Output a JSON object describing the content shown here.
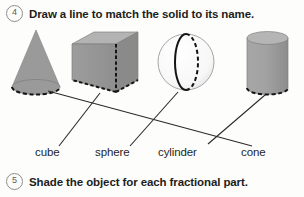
{
  "worksheet": {
    "problem4": {
      "number": "4",
      "prompt": "Draw a line to match the solid to its name."
    },
    "problem5": {
      "number": "5",
      "prompt": "Shade the object for each fractional part."
    },
    "labels": {
      "cube": "cube",
      "sphere": "sphere",
      "cylinder": "cylinder",
      "cone": "cone"
    },
    "solids": [
      {
        "name": "cone",
        "order": 1,
        "fill": "#9a9a9a",
        "hidden_edge": "dashed-base-ellipse"
      },
      {
        "name": "cube",
        "order": 2,
        "fill": "#9b9b9b",
        "hidden_edge": "dashed-back-edges"
      },
      {
        "name": "sphere",
        "order": 3,
        "fill": "#fbfbfb",
        "hidden_edge": "dashed-back-great-circle"
      },
      {
        "name": "cylinder",
        "order": 4,
        "fill": "#a0a0a0",
        "hidden_edge": "dashed-bottom-ellipse"
      }
    ],
    "connections": [
      {
        "from": "cone",
        "to": "cone"
      },
      {
        "from": "cube",
        "to": "cube"
      },
      {
        "from": "sphere",
        "to": "sphere"
      },
      {
        "from": "cylinder",
        "to": "cone"
      }
    ],
    "colors": {
      "ink": "#1d1d1d",
      "line": "#2a2a2a",
      "badge_border": "#8d8d8d",
      "solid_gray": "#9a9a9a",
      "paper": "#fdfdfb"
    }
  }
}
